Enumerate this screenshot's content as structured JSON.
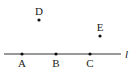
{
  "diagram": {
    "line": {
      "label": "l",
      "x1": 4,
      "x2": 121,
      "y": 54
    },
    "points": [
      {
        "id": "A",
        "label": "A",
        "x": 22,
        "y": 54,
        "label_x": 22,
        "label_y": 68
      },
      {
        "id": "B",
        "label": "B",
        "x": 56,
        "y": 54,
        "label_x": 56,
        "label_y": 68
      },
      {
        "id": "C",
        "label": "C",
        "x": 90,
        "y": 54,
        "label_x": 90,
        "label_y": 68
      },
      {
        "id": "D",
        "label": "D",
        "x": 39,
        "y": 20,
        "label_x": 39,
        "label_y": 16
      },
      {
        "id": "E",
        "label": "E",
        "x": 100,
        "y": 36,
        "label_x": 100,
        "label_y": 32
      }
    ],
    "colors": {
      "stroke": "#333333",
      "point": "#111111",
      "text": "#222222"
    }
  }
}
